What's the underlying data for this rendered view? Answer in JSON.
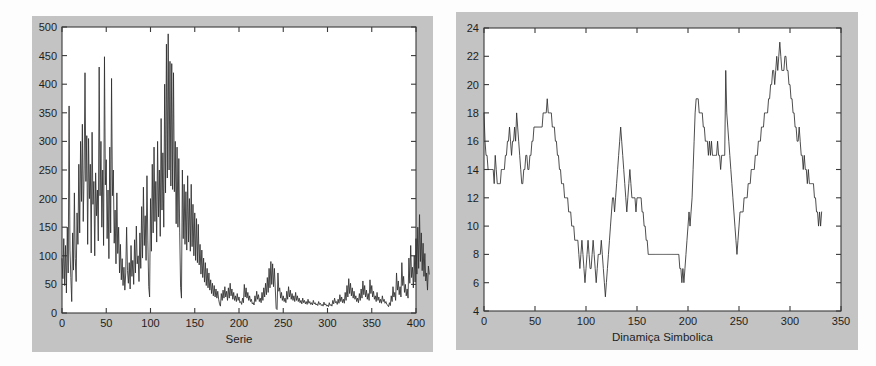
{
  "page": {
    "background_color": "#fdfdfd",
    "panel_color": "#c3c3c3",
    "plot_color": "#ffffff",
    "line_color": "#2e2e2e"
  },
  "charts": [
    {
      "id": "serie-chart",
      "name": "left-chart-serie",
      "title": "",
      "xlabel": "Serie",
      "ylabel": "",
      "xticks": [
        "0",
        "50",
        "100",
        "150",
        "200",
        "250",
        "300",
        "350",
        "400"
      ],
      "yticks": [
        "0",
        "50",
        "100",
        "150",
        "200",
        "250",
        "300",
        "350",
        "400",
        "450",
        "500"
      ]
    },
    {
      "id": "dinamica-chart",
      "name": "right-chart-dinamica-simbolica",
      "title": "",
      "xlabel": "Dinamiça Simbolica",
      "ylabel": "",
      "xticks": [
        "0",
        "50",
        "100",
        "150",
        "200",
        "250",
        "300",
        "350"
      ],
      "yticks": [
        "4",
        "6",
        "8",
        "10",
        "12",
        "14",
        "16",
        "18",
        "20",
        "22",
        "24"
      ]
    }
  ],
  "chart_data": [
    {
      "type": "line",
      "id": "serie-chart",
      "title": "",
      "xlabel": "Serie",
      "ylabel": "",
      "xlim": [
        0,
        400
      ],
      "ylim": [
        0,
        500
      ],
      "xtick_values": [
        0,
        50,
        100,
        150,
        200,
        250,
        300,
        350,
        400
      ],
      "ytick_values": [
        0,
        50,
        100,
        150,
        200,
        250,
        300,
        350,
        400,
        450,
        500
      ],
      "grid": false,
      "legend": null,
      "series": [
        {
          "name": "Serie",
          "x_start": 0,
          "x_step": 1,
          "values": [
            95,
            60,
            130,
            48,
            118,
            35,
            150,
            70,
            362,
            110,
            62,
            20,
            140,
            75,
            210,
            95,
            55,
            175,
            120,
            260,
            140,
            300,
            195,
            330,
            160,
            250,
            420,
            230,
            310,
            120,
            305,
            200,
            260,
            105,
            316,
            190,
            230,
            100,
            245,
            170,
            215,
            126,
            430,
            205,
            300,
            150,
            250,
            118,
            448,
            224,
            268,
            130,
            215,
            95,
            290,
            140,
            410,
            205,
            250,
            122,
            180,
            86,
            210,
            104,
            150,
            70,
            120,
            58,
            95,
            48,
            80,
            40,
            70,
            150,
            74,
            52,
            88,
            42,
            118,
            64,
            92,
            50,
            128,
            70,
            152,
            86,
            100,
            55,
            140,
            78,
            186,
            96,
            220,
            118,
            170,
            92,
            240,
            126,
            46,
            28,
            200,
            108,
            260,
            140,
            290,
            160,
            230,
            124,
            300,
            168,
            250,
            134,
            340,
            180,
            280,
            150,
            400,
            210,
            470,
            236,
            488,
            250,
            440,
            222,
            436,
            216,
            420,
            212,
            300,
            156,
            290,
            150,
            270,
            140,
            45,
            26,
            250,
            130,
            225,
            120,
            212,
            110,
            240,
            124,
            200,
            108,
            225,
            116,
            190,
            100,
            175,
            92,
            165,
            88,
            155,
            84,
            120,
            68,
            110,
            62,
            96,
            54,
            88,
            48,
            78,
            44,
            70,
            40,
            58,
            34,
            52,
            30,
            48,
            28,
            42,
            26,
            38,
            24,
            16,
            12,
            34,
            22,
            40,
            26,
            46,
            28,
            38,
            22,
            44,
            26,
            52,
            30,
            42,
            24,
            36,
            22,
            30,
            20,
            34,
            22,
            28,
            18,
            20,
            15,
            26,
            18,
            50,
            28,
            44,
            26,
            36,
            22,
            30,
            20,
            24,
            16,
            18,
            14,
            30,
            20,
            38,
            24,
            32,
            20,
            26,
            18,
            36,
            22,
            44,
            28,
            52,
            32,
            62,
            36,
            78,
            44,
            90,
            50,
            86,
            46,
            78,
            42,
            8,
            6,
            70,
            38,
            44,
            26,
            36,
            22,
            30,
            20,
            26,
            18,
            38,
            24,
            46,
            28,
            40,
            24,
            34,
            22,
            30,
            20,
            36,
            22,
            30,
            20,
            26,
            18,
            22,
            16,
            26,
            18,
            22,
            16,
            20,
            15,
            24,
            17,
            20,
            15,
            18,
            14,
            22,
            16,
            18,
            14,
            16,
            13,
            20,
            15,
            17,
            13,
            15,
            12,
            19,
            14,
            16,
            12,
            14,
            11,
            18,
            13,
            15,
            12,
            22,
            16,
            26,
            18,
            20,
            15,
            24,
            17,
            32,
            20,
            28,
            18,
            24,
            17,
            36,
            22,
            48,
            28,
            60,
            34,
            52,
            30,
            44,
            26,
            38,
            24,
            30,
            20,
            26,
            18,
            34,
            22,
            42,
            26,
            56,
            32,
            48,
            28,
            40,
            24,
            34,
            22,
            58,
            34,
            48,
            28,
            38,
            24,
            30,
            20,
            36,
            22,
            28,
            18,
            24,
            17,
            30,
            20,
            24,
            17,
            20,
            15,
            14,
            11,
            18,
            13,
            30,
            20,
            46,
            28,
            36,
            22,
            70,
            40,
            56,
            32,
            46,
            28,
            88,
            48,
            64,
            36,
            50,
            30,
            42,
            26,
            96,
            52,
            118,
            62,
            80,
            44,
            100,
            54,
            130,
            68,
            150,
            78,
            172,
            90,
            140,
            74,
            122,
            64,
            104,
            56,
            70,
            40,
            82,
            68
          ]
        }
      ]
    },
    {
      "type": "line",
      "id": "dinamica-chart",
      "title": "",
      "xlabel": "Dinamiça Simbolica",
      "ylabel": "",
      "xlim": [
        0,
        350
      ],
      "ylim": [
        4,
        24
      ],
      "xtick_values": [
        0,
        50,
        100,
        150,
        200,
        250,
        300,
        350
      ],
      "ytick_values": [
        4,
        6,
        8,
        10,
        12,
        14,
        16,
        18,
        20,
        22,
        24
      ],
      "grid": false,
      "legend": null,
      "series": [
        {
          "name": "Dinamiça Simbolica",
          "x_start": 0,
          "x_step": 1,
          "values": [
            18,
            16,
            15,
            15,
            14,
            14,
            14,
            14,
            14,
            14,
            13,
            15,
            14,
            13,
            13,
            13,
            13,
            14,
            14,
            14,
            14,
            15,
            15,
            16,
            16,
            17,
            16,
            15,
            16,
            16,
            17,
            16,
            18,
            17,
            16,
            15,
            14,
            13,
            13,
            14,
            14,
            15,
            15,
            14,
            14,
            15,
            15,
            16,
            16,
            17,
            17,
            17,
            17,
            17,
            17,
            17,
            17,
            17,
            18,
            18,
            18,
            18,
            19,
            18,
            18,
            18,
            18,
            17,
            17,
            17,
            16,
            16,
            15,
            15,
            14,
            14,
            13,
            13,
            13,
            12,
            12,
            12,
            12,
            11,
            11,
            11,
            10,
            10,
            10,
            9,
            9,
            9,
            9,
            8,
            7,
            8,
            9,
            8,
            7,
            6,
            7,
            8,
            9,
            8,
            7,
            7,
            8,
            9,
            8,
            7,
            6,
            7,
            8,
            8,
            8,
            9,
            8,
            7,
            6,
            5,
            6,
            7,
            8,
            9,
            10,
            11,
            12,
            12,
            11,
            12,
            13,
            14,
            15,
            16,
            17,
            16,
            15,
            14,
            13,
            12,
            11,
            12,
            13,
            14,
            13,
            12,
            12,
            12,
            12,
            11,
            12,
            12,
            12,
            12,
            12,
            11,
            11,
            10,
            10,
            9,
            9,
            8,
            8,
            8,
            8,
            8,
            8,
            8,
            8,
            8,
            8,
            8,
            8,
            8,
            8,
            8,
            8,
            8,
            8,
            8,
            8,
            8,
            8,
            8,
            8,
            8,
            8,
            8,
            8,
            8,
            8,
            8,
            7,
            7,
            6,
            7,
            6,
            7,
            8,
            9,
            10,
            11,
            10,
            11,
            12,
            14,
            16,
            18,
            19,
            19,
            19,
            18,
            18,
            18,
            18,
            17,
            17,
            16,
            16,
            16,
            15,
            16,
            15,
            16,
            15,
            15,
            15,
            15,
            15,
            16,
            15,
            15,
            14,
            15,
            15,
            15,
            15,
            21,
            18,
            17,
            16,
            15,
            14,
            13,
            12,
            11,
            10,
            9,
            8,
            9,
            10,
            11,
            11,
            11,
            11,
            12,
            12,
            12,
            12,
            13,
            13,
            13,
            14,
            14,
            14,
            14,
            15,
            15,
            15,
            16,
            16,
            16,
            17,
            17,
            17,
            18,
            18,
            18,
            18,
            19,
            19,
            20,
            20,
            21,
            21,
            20,
            21,
            22,
            21,
            22,
            23,
            22,
            21,
            21,
            21,
            22,
            22,
            21,
            21,
            20,
            20,
            19,
            19,
            18,
            18,
            17,
            17,
            16,
            16,
            17,
            16,
            15,
            15,
            14,
            15,
            14,
            14,
            13,
            14,
            13,
            13,
            13,
            13,
            13,
            12,
            12,
            11,
            11,
            10,
            11,
            10,
            11
          ]
        }
      ]
    }
  ]
}
